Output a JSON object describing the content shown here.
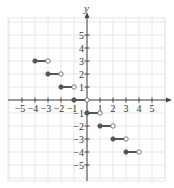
{
  "chart_data": {
    "type": "step",
    "title": "",
    "xlabel": "x",
    "ylabel": "y",
    "xlim": [
      -6,
      6
    ],
    "ylim": [
      -6,
      6
    ],
    "grid": true,
    "x_ticks": [
      -5,
      -4,
      -3,
      -2,
      -1,
      1,
      2,
      3,
      4,
      5
    ],
    "y_ticks": [
      5,
      4,
      3,
      2,
      1,
      -1,
      -2,
      -3,
      -4,
      -5
    ],
    "x_tick_labels": [
      "-5",
      "-4",
      "-3",
      "-2",
      "-1",
      "1",
      "2",
      "3",
      "4",
      "5"
    ],
    "y_tick_labels": [
      "5",
      "4",
      "3",
      "2",
      "1",
      "-1",
      "-2",
      "-3",
      "-4",
      "-5"
    ],
    "segments": [
      {
        "x_start": -4,
        "x_end": -3,
        "y": 3,
        "start": "closed",
        "end": "open"
      },
      {
        "x_start": -3,
        "x_end": -2,
        "y": 2,
        "start": "closed",
        "end": "open"
      },
      {
        "x_start": -2,
        "x_end": -1,
        "y": 1,
        "start": "closed",
        "end": "open"
      },
      {
        "x_start": -1,
        "x_end": 0,
        "y": 0,
        "start": "closed",
        "end": "open"
      },
      {
        "x_start": 0,
        "x_end": 1,
        "y": -1,
        "start": "closed",
        "end": "open"
      },
      {
        "x_start": 1,
        "x_end": 2,
        "y": -2,
        "start": "closed",
        "end": "open"
      },
      {
        "x_start": 2,
        "x_end": 3,
        "y": -3,
        "start": "closed",
        "end": "open"
      },
      {
        "x_start": 3,
        "x_end": 4,
        "y": -4,
        "start": "closed",
        "end": "open"
      }
    ]
  },
  "style": {
    "grid_color": "#e6e6e6",
    "axis_color": "#444444",
    "segment_color": "#555555",
    "origin_px": [
      87,
      100
    ],
    "unit_px": 13,
    "grid_bounds_px": {
      "left": 8,
      "right": 165,
      "top": 18,
      "bottom": 181
    }
  }
}
